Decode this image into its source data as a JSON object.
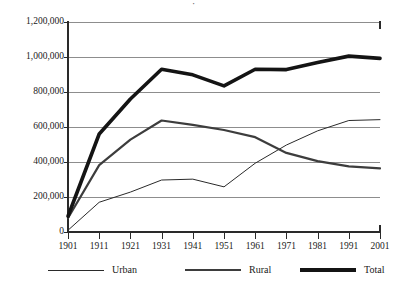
{
  "title_sliver": "·",
  "chart_data": {
    "type": "line",
    "title": "",
    "xlabel": "",
    "ylabel": "",
    "x": [
      1901,
      1911,
      1921,
      1931,
      1941,
      1951,
      1961,
      1971,
      1981,
      1991,
      2001
    ],
    "xtick_labels": [
      "1901",
      "1911",
      "1921",
      "1931",
      "1941",
      "1951",
      "1961",
      "1971",
      "1981",
      "1991",
      "2001"
    ],
    "ytick_labels": [
      "1,200,000",
      "1,000,000",
      "800,000",
      "600,000",
      "400,000",
      "200,000",
      "0"
    ],
    "ytick_values": [
      1200000,
      1000000,
      800000,
      600000,
      400000,
      200000,
      0
    ],
    "ylim": [
      0,
      1200000
    ],
    "grid": true,
    "legend_position": "bottom",
    "series": [
      {
        "name": "Urban",
        "style": "thin",
        "color": "#2a2a2a",
        "width": 1,
        "values": [
          10000,
          170000,
          228000,
          297000,
          302000,
          258000,
          393000,
          497000,
          578000,
          637000,
          642000
        ]
      },
      {
        "name": "Rural",
        "style": "medium",
        "color": "#3d3d3d",
        "width": 2.2,
        "values": [
          80000,
          382000,
          528000,
          637000,
          612000,
          583000,
          542000,
          452000,
          405000,
          375000,
          363000
        ]
      },
      {
        "name": "Total",
        "style": "thick",
        "color": "#141414",
        "width": 3.6,
        "values": [
          90000,
          560000,
          760000,
          930000,
          898000,
          835000,
          930000,
          928000,
          968000,
          1005000,
          992000
        ]
      }
    ]
  },
  "legend": {
    "entries": [
      {
        "label": "Urban",
        "swatch": "thin-line-swatch"
      },
      {
        "label": "Rural",
        "swatch": "medium-line-swatch"
      },
      {
        "label": "Total",
        "swatch": "thick-line-swatch"
      }
    ]
  }
}
